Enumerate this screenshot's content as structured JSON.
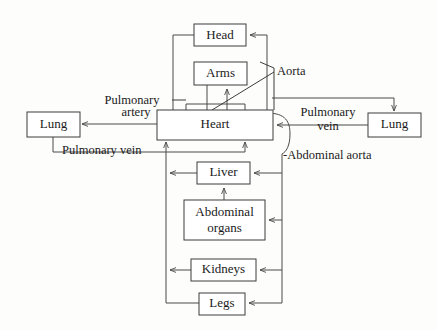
{
  "diagram": {
    "canvas": {
      "width": 437,
      "height": 330
    },
    "colors": {
      "background": "#fdfdfb",
      "box_fill": "#ffffff",
      "box_stroke": "#3d3d3d",
      "vessel_stroke": "#4a4a4a",
      "text": "#1a1a1a"
    },
    "nodes": {
      "head": {
        "label": "Head",
        "x": 194,
        "y": 24,
        "w": 52,
        "h": 22,
        "font_size": 13
      },
      "arms": {
        "label": "Arms",
        "x": 194,
        "y": 62,
        "w": 53,
        "h": 23,
        "font_size": 13
      },
      "heart": {
        "label": "Heart",
        "x": 157,
        "y": 110,
        "w": 116,
        "h": 30,
        "font_size": 13
      },
      "lung_left": {
        "label": "Lung",
        "x": 27,
        "y": 112,
        "w": 53,
        "h": 25,
        "font_size": 13
      },
      "lung_right": {
        "label": "Lung",
        "x": 368,
        "y": 113,
        "w": 53,
        "h": 24,
        "font_size": 13
      },
      "liver": {
        "label": "Liver",
        "x": 197,
        "y": 162,
        "w": 53,
        "h": 22,
        "font_size": 13
      },
      "abdominal_organs": {
        "label_line1": "Abdominal",
        "label_line2": "organs",
        "x": 184,
        "y": 200,
        "w": 81,
        "h": 40,
        "font_size": 13
      },
      "kidneys": {
        "label": "Kidneys",
        "x": 191,
        "y": 259,
        "w": 65,
        "h": 22,
        "font_size": 13
      },
      "legs": {
        "label": "Legs",
        "x": 199,
        "y": 293,
        "w": 46,
        "h": 22,
        "font_size": 13
      }
    },
    "edge_labels": [
      {
        "name": "pulmonary-artery-label",
        "line1": "Pulmonary",
        "line2": "artery",
        "x": 132,
        "y": 104,
        "anchor": "middle",
        "font_size": 12.5
      },
      {
        "name": "pulmonary-vein-left-label",
        "line1": "Pulmonary vein",
        "x": 62,
        "y": 154,
        "anchor": "start",
        "font_size": 12.5
      },
      {
        "name": "pulmonary-vein-right-label",
        "line1": "Pulmonary",
        "line2": "vein",
        "x": 328,
        "y": 116,
        "anchor": "middle",
        "font_size": 12.5
      },
      {
        "name": "aorta-label",
        "line1": "Aorta",
        "x": 277,
        "y": 75,
        "anchor": "start",
        "font_size": 12.5
      },
      {
        "name": "abdominal-aorta-label",
        "line1": "-Abdominal aorta",
        "x": 283,
        "y": 159,
        "anchor": "start",
        "font_size": 12.5
      }
    ]
  }
}
